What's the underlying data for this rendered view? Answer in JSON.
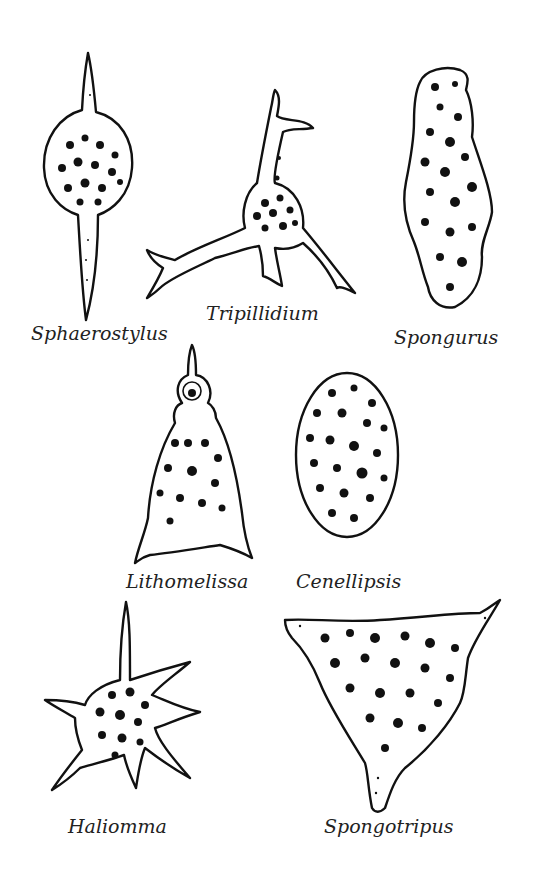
{
  "figure": {
    "type": "illustration-plate",
    "specimens": [
      {
        "id": "sphaerostylus",
        "label": "Sphaerostylus",
        "shape": "sphere-with-two-polar-spines"
      },
      {
        "id": "tripillidium",
        "label": "Tripillidium",
        "shape": "tripod-with-branched-spines"
      },
      {
        "id": "spongurus",
        "label": "Spongurus",
        "shape": "elongate-spongy-body"
      },
      {
        "id": "lithomelissa",
        "label": "Lithomelissa",
        "shape": "cone-with-apical-horn"
      },
      {
        "id": "cenellipsis",
        "label": "Cenellipsis",
        "shape": "ellipsoid"
      },
      {
        "id": "haliomma",
        "label": "Haliomma",
        "shape": "star-with-radial-spines"
      },
      {
        "id": "spongotripus",
        "label": "Spongotripus",
        "shape": "triangular-three-spined"
      }
    ]
  },
  "colors": {
    "ink": "#111111",
    "background": "#ffffff",
    "label": "#222222"
  }
}
